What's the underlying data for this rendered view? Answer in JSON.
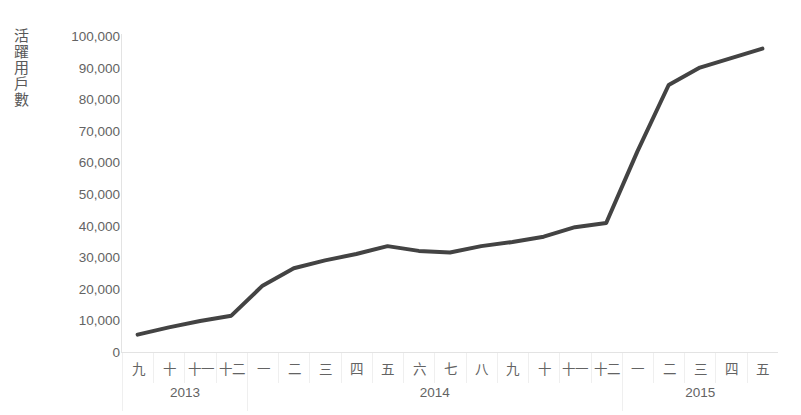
{
  "top_ghost_text": "",
  "axis": {
    "y_title": "活躍用戶數",
    "y_title_chars": [
      "活",
      "躍",
      "用",
      "戶",
      "數"
    ],
    "y_ticks": [
      "100,000",
      "90,000",
      "80,000",
      "70,000",
      "60,000",
      "50,000",
      "40,000",
      "30,000",
      "20,000",
      "10,000",
      "0"
    ]
  },
  "chart_data": {
    "type": "line",
    "title": "",
    "xlabel": "",
    "ylabel": "活躍用戶數",
    "ylim": [
      0,
      100000
    ],
    "ytick_values": [
      0,
      10000,
      20000,
      30000,
      40000,
      50000,
      60000,
      70000,
      80000,
      90000,
      100000
    ],
    "grid": false,
    "legend": "none",
    "line_color": "#434343",
    "line_width": 4,
    "categories": [
      "九",
      "十",
      "十一",
      "十二",
      "一",
      "二",
      "三",
      "四",
      "五",
      "六",
      "七",
      "八",
      "九",
      "十",
      "十一",
      "十二",
      "一",
      "二",
      "三",
      "四",
      "五"
    ],
    "values": [
      5500,
      7800,
      9800,
      11500,
      21000,
      26500,
      29000,
      31000,
      33500,
      32000,
      31500,
      33500,
      34800,
      36500,
      39500,
      40800,
      63500,
      84500,
      90000,
      93000,
      96000
    ],
    "year_groups": [
      {
        "year": "2013",
        "count": 4
      },
      {
        "year": "2014",
        "count": 12
      },
      {
        "year": "2015",
        "count": 5
      }
    ]
  }
}
